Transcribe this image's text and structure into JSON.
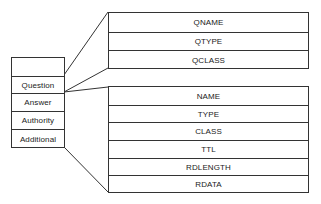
{
  "message_sections": {
    "header_label": "",
    "items": [
      "Question",
      "Answer",
      "Authority",
      "Additional"
    ]
  },
  "question_fields": [
    "QNAME",
    "QTYPE",
    "QCLASS"
  ],
  "resource_record_fields": [
    "NAME",
    "TYPE",
    "CLASS",
    "TTL",
    "RDLENGTH",
    "RDATA"
  ]
}
